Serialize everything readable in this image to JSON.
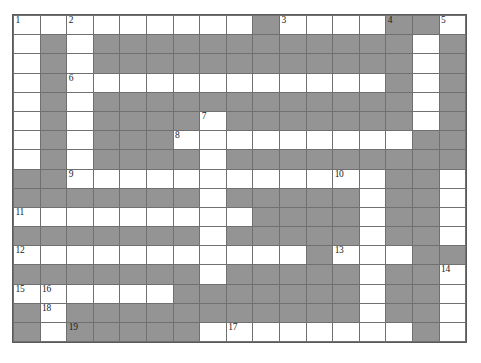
{
  "puzzle": {
    "title": "Crossword Grid",
    "columns": 17,
    "rows": 17,
    "colors": {
      "open_cell": "#ffffff",
      "blocked_cell": "#949494",
      "grid_line": "#707070",
      "number_text": "#1a1a1a",
      "background": "#ffffff"
    },
    "legend": {
      "open": "white fillable letter cell",
      "block": "gray blocked cell"
    },
    "clue_numbers": [
      1,
      2,
      3,
      4,
      5,
      6,
      7,
      8,
      9,
      10,
      11,
      12,
      13,
      14,
      15,
      16,
      17,
      18,
      19
    ],
    "grid": [
      [
        "open",
        "open",
        "open",
        "open",
        "open",
        "open",
        "open",
        "open",
        "open",
        "block",
        "open",
        "open",
        "open",
        "open",
        "block",
        "block",
        "open"
      ],
      [
        "open",
        "block",
        "open",
        "block",
        "block",
        "block",
        "block",
        "block",
        "block",
        "block",
        "block",
        "block",
        "block",
        "block",
        "block",
        "open",
        "block"
      ],
      [
        "open",
        "block",
        "open",
        "block",
        "block",
        "block",
        "block",
        "block",
        "block",
        "block",
        "block",
        "block",
        "block",
        "block",
        "block",
        "open",
        "block"
      ],
      [
        "open",
        "block",
        "open",
        "open",
        "open",
        "open",
        "open",
        "open",
        "open",
        "open",
        "open",
        "open",
        "open",
        "open",
        "block",
        "open",
        "block"
      ],
      [
        "open",
        "block",
        "open",
        "block",
        "block",
        "block",
        "block",
        "block",
        "block",
        "block",
        "block",
        "block",
        "block",
        "block",
        "block",
        "open",
        "block"
      ],
      [
        "open",
        "block",
        "open",
        "block",
        "block",
        "block",
        "block",
        "open",
        "block",
        "block",
        "block",
        "block",
        "block",
        "block",
        "block",
        "open",
        "block"
      ],
      [
        "open",
        "block",
        "open",
        "block",
        "block",
        "block",
        "open",
        "open",
        "open",
        "open",
        "open",
        "open",
        "open",
        "open",
        "open",
        "block",
        "block"
      ],
      [
        "open",
        "block",
        "open",
        "block",
        "block",
        "block",
        "block",
        "open",
        "block",
        "block",
        "block",
        "block",
        "block",
        "block",
        "block",
        "block",
        "block"
      ],
      [
        "block",
        "block",
        "open",
        "open",
        "open",
        "open",
        "open",
        "open",
        "open",
        "open",
        "open",
        "open",
        "open",
        "open",
        "block",
        "block",
        "open"
      ],
      [
        "block",
        "block",
        "block",
        "block",
        "block",
        "block",
        "block",
        "open",
        "block",
        "block",
        "block",
        "block",
        "block",
        "open",
        "block",
        "block",
        "open"
      ],
      [
        "open",
        "open",
        "open",
        "open",
        "open",
        "open",
        "open",
        "open",
        "open",
        "block",
        "block",
        "block",
        "block",
        "open",
        "block",
        "block",
        "open"
      ],
      [
        "block",
        "block",
        "block",
        "block",
        "block",
        "block",
        "block",
        "open",
        "block",
        "block",
        "block",
        "block",
        "block",
        "open",
        "block",
        "block",
        "open"
      ],
      [
        "open",
        "open",
        "open",
        "open",
        "open",
        "open",
        "open",
        "open",
        "open",
        "open",
        "open",
        "block",
        "open",
        "open",
        "open",
        "block",
        "block"
      ],
      [
        "block",
        "block",
        "block",
        "block",
        "block",
        "block",
        "block",
        "open",
        "block",
        "block",
        "block",
        "block",
        "block",
        "open",
        "block",
        "block",
        "open"
      ],
      [
        "open",
        "open",
        "open",
        "open",
        "open",
        "open",
        "block",
        "block",
        "block",
        "block",
        "block",
        "block",
        "block",
        "open",
        "block",
        "block",
        "open"
      ],
      [
        "block",
        "open",
        "block",
        "block",
        "block",
        "block",
        "block",
        "block",
        "block",
        "block",
        "block",
        "block",
        "block",
        "open",
        "block",
        "block",
        "open"
      ],
      [
        "block",
        "open",
        "block",
        "block",
        "block",
        "block",
        "block",
        "open",
        "open",
        "open",
        "open",
        "open",
        "open",
        "open",
        "open",
        "block",
        "open"
      ]
    ],
    "numbers": [
      {
        "n": "1",
        "row": 0,
        "col": 0
      },
      {
        "n": "2",
        "row": 0,
        "col": 2
      },
      {
        "n": "3",
        "row": 0,
        "col": 10
      },
      {
        "n": "4",
        "row": 0,
        "col": 14
      },
      {
        "n": "5",
        "row": 0,
        "col": 16
      },
      {
        "n": "6",
        "row": 3,
        "col": 2
      },
      {
        "n": "7",
        "row": 5,
        "col": 7
      },
      {
        "n": "8",
        "row": 6,
        "col": 6
      },
      {
        "n": "9",
        "row": 8,
        "col": 2
      },
      {
        "n": "10",
        "row": 8,
        "col": 12
      },
      {
        "n": "11",
        "row": 10,
        "col": 0
      },
      {
        "n": "12",
        "row": 12,
        "col": 0
      },
      {
        "n": "13",
        "row": 12,
        "col": 12
      },
      {
        "n": "14",
        "row": 13,
        "col": 16
      },
      {
        "n": "15",
        "row": 14,
        "col": 0
      },
      {
        "n": "16",
        "row": 14,
        "col": 1
      },
      {
        "n": "17",
        "row": 16,
        "col": 8
      },
      {
        "n": "18",
        "row": 15,
        "col": 1
      },
      {
        "n": "19",
        "row": 16,
        "col": 2
      }
    ]
  }
}
